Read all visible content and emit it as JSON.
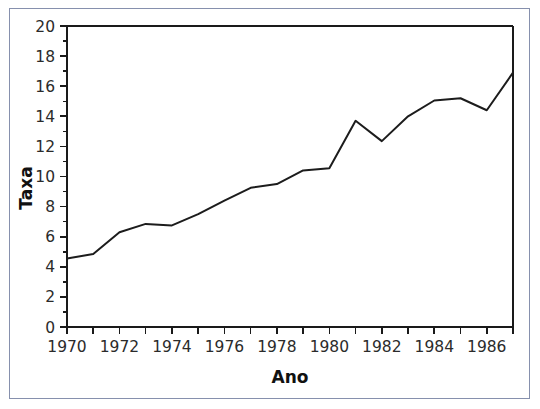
{
  "figure": {
    "border_color": "#8690ad",
    "background": "#ffffff",
    "line_color": "#1c1c1c",
    "axis_color": "#1a1a1a"
  },
  "chart_data": {
    "type": "line",
    "title": "",
    "subtitle": "",
    "xlabel": "Ano",
    "ylabel": "Taxa",
    "xlim": [
      1970,
      1987
    ],
    "ylim": [
      0,
      20
    ],
    "grid": false,
    "legend": false,
    "x_major_ticks": [
      1970,
      1972,
      1974,
      1976,
      1978,
      1980,
      1982,
      1984,
      1986
    ],
    "x_major_tick_labels": [
      "1970",
      "1972",
      "1974",
      "1976",
      "1978",
      "1980",
      "1982",
      "1984",
      "1986"
    ],
    "x_minor_ticks": [
      1971,
      1973,
      1975,
      1977,
      1979,
      1981,
      1983,
      1985,
      1987
    ],
    "y_major_ticks": [
      0,
      2,
      4,
      6,
      8,
      10,
      12,
      14,
      16,
      18,
      20
    ],
    "y_major_tick_labels": [
      "0",
      "2",
      "4",
      "6",
      "8",
      "10",
      "12",
      "14",
      "16",
      "18",
      "20"
    ],
    "y_minor_ticks": [
      1,
      3,
      5,
      7,
      9,
      11,
      13,
      15,
      17,
      19
    ],
    "x": [
      1970,
      1971,
      1972,
      1973,
      1974,
      1975,
      1976,
      1977,
      1978,
      1979,
      1980,
      1981,
      1982,
      1983,
      1984,
      1985,
      1986,
      1987
    ],
    "values": [
      4.55,
      4.85,
      6.3,
      6.85,
      6.75,
      7.5,
      8.4,
      9.25,
      9.5,
      10.4,
      10.55,
      13.7,
      12.35,
      14.0,
      15.05,
      15.2,
      14.4,
      16.9
    ],
    "series": [
      {
        "name": "Taxa",
        "values": [
          4.55,
          4.85,
          6.3,
          6.85,
          6.75,
          7.5,
          8.4,
          9.25,
          9.5,
          10.4,
          10.55,
          13.7,
          12.35,
          14.0,
          15.05,
          15.2,
          14.4,
          16.9
        ]
      }
    ]
  }
}
